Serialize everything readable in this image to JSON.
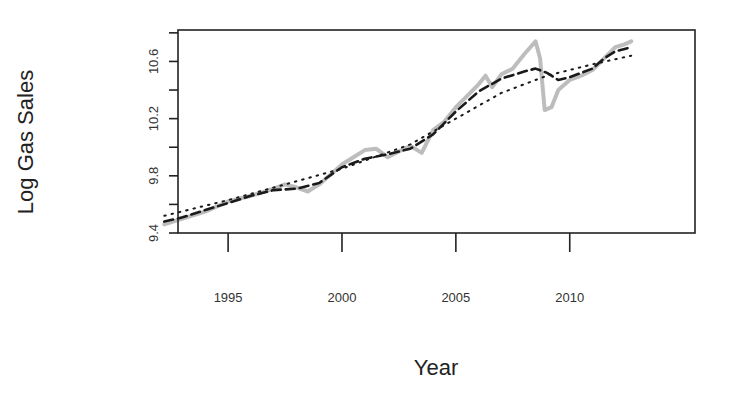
{
  "chart_data": {
    "type": "line",
    "title": "",
    "xlabel": "Year",
    "ylabel": "Log Gas Sales",
    "xlim": [
      1992.8,
      2015.5
    ],
    "ylim": [
      9.4,
      10.82
    ],
    "xticks": [
      1995,
      2000,
      2005,
      2010
    ],
    "xtick_labels": [
      "1995",
      "2000",
      "2005",
      "2010"
    ],
    "yticks": [
      9.4,
      9.6,
      9.8,
      10.0,
      10.2,
      10.4,
      10.6,
      10.8
    ],
    "ytick_labels": [
      "9.4",
      "",
      "9.8",
      "",
      "10.2",
      "",
      "10.6",
      ""
    ],
    "grid": false,
    "legend": null,
    "series": [
      {
        "name": "observed",
        "style": "solid",
        "color": "#bdbdbd",
        "x": [
          1992.2,
          1993,
          1994,
          1995,
          1996,
          1997,
          1997.5,
          1998,
          1998.5,
          1999,
          2000,
          2000.5,
          2001,
          2001.5,
          2002,
          2002.5,
          2003,
          2003.5,
          2004,
          2004.5,
          2005,
          2005.5,
          2006,
          2006.3,
          2006.6,
          2007,
          2007.5,
          2008,
          2008.5,
          2008.7,
          2008.9,
          2009.2,
          2009.5,
          2010,
          2010.5,
          2011,
          2011.5,
          2012,
          2012.4,
          2012.7
        ],
        "values": [
          9.46,
          9.5,
          9.55,
          9.62,
          9.66,
          9.71,
          9.74,
          9.72,
          9.69,
          9.74,
          9.88,
          9.93,
          9.98,
          9.99,
          9.93,
          9.97,
          10.01,
          9.96,
          10.12,
          10.18,
          10.28,
          10.36,
          10.44,
          10.5,
          10.42,
          10.51,
          10.55,
          10.65,
          10.74,
          10.62,
          10.26,
          10.28,
          10.4,
          10.47,
          10.5,
          10.54,
          10.62,
          10.7,
          10.72,
          10.74
        ]
      },
      {
        "name": "smoothed",
        "style": "dashed",
        "color": "#1a1a1a",
        "x": [
          1992.2,
          1993,
          1994,
          1995,
          1996,
          1997,
          1998,
          1999,
          2000,
          2001,
          2002,
          2003,
          2004,
          2005,
          2006,
          2007,
          2008,
          2008.5,
          2009,
          2009.5,
          2010,
          2010.5,
          2011,
          2011.5,
          2012,
          2012.7
        ],
        "values": [
          9.48,
          9.51,
          9.56,
          9.61,
          9.66,
          9.7,
          9.71,
          9.75,
          9.86,
          9.92,
          9.95,
          9.99,
          10.09,
          10.25,
          10.39,
          10.48,
          10.53,
          10.55,
          10.52,
          10.47,
          10.49,
          10.52,
          10.55,
          10.62,
          10.67,
          10.7
        ]
      },
      {
        "name": "trend",
        "style": "dotted",
        "color": "#1a1a1a",
        "x": [
          1992.2,
          1995,
          2000,
          2003,
          2005,
          2007,
          2009,
          2011,
          2012.7
        ],
        "values": [
          9.52,
          9.63,
          9.85,
          10.02,
          10.2,
          10.38,
          10.5,
          10.58,
          10.64
        ]
      }
    ]
  }
}
